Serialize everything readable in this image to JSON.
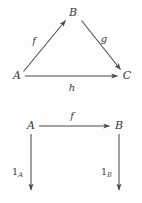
{
  "figure": {
    "kind": "commutative-diagram-pair",
    "background_color": "#fdfdfd",
    "stroke_color": "#4a4a4a",
    "text_color": "#3a3a3a"
  },
  "diagram_top": {
    "name": "triangle-commutative-diagram",
    "objects": [
      {
        "id": "A",
        "label": "A",
        "x": 17,
        "y": 76
      },
      {
        "id": "B",
        "label": "B",
        "x": 73,
        "y": 13
      },
      {
        "id": "C",
        "label": "C",
        "x": 127,
        "y": 76
      }
    ],
    "morphisms": [
      {
        "id": "f",
        "label": "f",
        "from": "A",
        "to": "B",
        "label_x": 34,
        "label_y": 41
      },
      {
        "id": "g",
        "label": "g",
        "from": "B",
        "to": "C",
        "label_x": 104,
        "label_y": 39
      },
      {
        "id": "h",
        "label": "h",
        "from": "A",
        "to": "C",
        "label_x": 72,
        "label_y": 88
      }
    ]
  },
  "diagram_bottom": {
    "name": "square-commutative-diagram",
    "objects": [
      {
        "id": "A",
        "label": "A",
        "x": 31,
        "y": 126
      },
      {
        "id": "B",
        "label": "B",
        "x": 119,
        "y": 126
      }
    ],
    "morphisms": [
      {
        "id": "f",
        "label": "f",
        "from": "A",
        "to": "B",
        "label_x": 72,
        "label_y": 116
      },
      {
        "id": "1A",
        "label": "1",
        "subscript": "A",
        "from": "A",
        "to": "down",
        "label_x": 15,
        "label_y": 172
      },
      {
        "id": "1B",
        "label": "1",
        "subscript": "B",
        "from": "B",
        "to": "down",
        "label_x": 104,
        "label_y": 172
      }
    ]
  }
}
